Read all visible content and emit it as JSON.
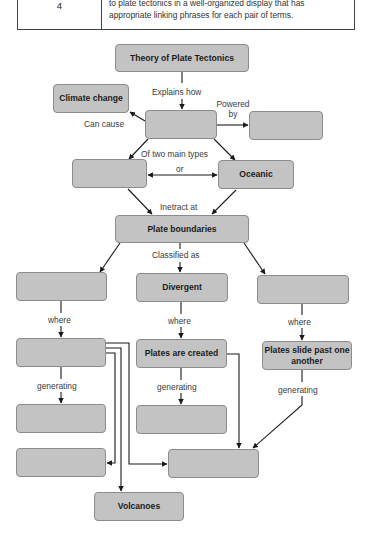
{
  "rubric": {
    "score": "4",
    "description_lines": [
      "to plate tectonics in a well-organized display that has",
      "appropriate linking phrases for each pair of terms."
    ]
  },
  "concept_map": {
    "style": {
      "node_fill": "#c3c3c3",
      "node_border": "#8c8c8c",
      "line_color": "#1a1a1a"
    },
    "nodes": {
      "theory": "Theory of Plate Tectonics",
      "climate_change": "Climate change",
      "plate_motion_blank": "",
      "power_source_blank": "",
      "continental_blank": "",
      "oceanic": "Oceanic",
      "plate_boundaries": "Plate boundaries",
      "convergent_blank": "",
      "divergent": "Divergent",
      "transform_blank": "",
      "convergent_where_blank": "",
      "plates_created": "Plates are created",
      "plates_slide": "Plates slide past one another",
      "convergent_generating_blank": "",
      "divergent_generating_blank": "",
      "convergent_extra_blank": "",
      "shared_result_blank": "",
      "volcanoes": "Volcanoes"
    },
    "links": {
      "explains_how": "Explains how",
      "can_cause": "Can cause",
      "powered_by_1": "Powered",
      "powered_by_2": "by",
      "of_two_main_types": "Of two main types",
      "or": "or",
      "interact_at": "Inetract at",
      "classified_as": "Classified as",
      "where_left": "where",
      "where_mid": "where",
      "where_right": "where",
      "generating_left": "generating",
      "generating_mid": "generating",
      "generating_right": "generating"
    }
  }
}
